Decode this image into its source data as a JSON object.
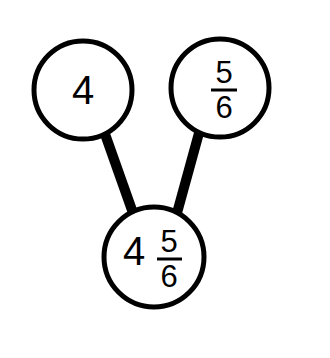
{
  "diagram": {
    "type": "number-bond",
    "background_color": "#ffffff",
    "stroke_color": "#000000",
    "nodes": [
      {
        "id": "part-left",
        "role": "part",
        "label": "4",
        "value_type": "whole",
        "whole": "4",
        "numerator": "",
        "denominator": "",
        "cx": 83,
        "cy": 90,
        "r": 49,
        "stroke_width": 5
      },
      {
        "id": "part-right",
        "role": "part",
        "label": "5/6",
        "value_type": "fraction",
        "whole": "",
        "numerator": "5",
        "denominator": "6",
        "cx": 220,
        "cy": 88,
        "r": 49,
        "stroke_width": 5
      },
      {
        "id": "whole-bottom",
        "role": "total",
        "label": "4 5/6",
        "value_type": "mixed",
        "whole": "4",
        "numerator": "5",
        "denominator": "6",
        "cx": 154,
        "cy": 257,
        "r": 50,
        "stroke_width": 5
      }
    ],
    "connectors": [
      {
        "id": "connector-left",
        "from": "part-left",
        "to": "whole-bottom",
        "x1": 105,
        "y1": 134,
        "x2": 133,
        "y2": 213,
        "width": 10
      },
      {
        "id": "connector-right",
        "from": "part-right",
        "to": "whole-bottom",
        "x1": 199,
        "y1": 133,
        "x2": 177,
        "y2": 213,
        "width": 10
      }
    ]
  }
}
